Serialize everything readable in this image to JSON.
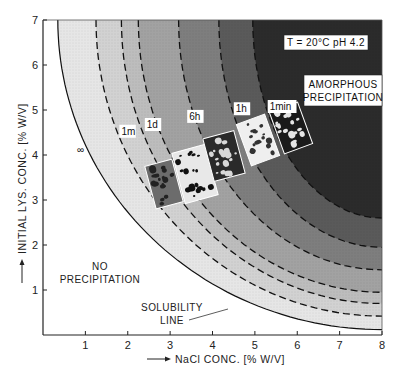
{
  "chart_data": {
    "type": "area",
    "title": "",
    "xlabel": "NaCl CONC. [% W/V]",
    "ylabel": "INITIAL LYS. CONC. [% W/V]",
    "xlim": [
      0,
      8
    ],
    "ylim": [
      0,
      7
    ],
    "x_ticks": [
      "1",
      "2",
      "3",
      "4",
      "5",
      "6",
      "7",
      "8"
    ],
    "y_ticks": [
      "1",
      "2",
      "3",
      "4",
      "5",
      "6",
      "7"
    ],
    "grid": false,
    "conditions_label": "T = 20°C  pH 4.2",
    "regions": [
      {
        "name": "NO PRECIPITATION",
        "label_lines": [
          "NO",
          "PRECIPITATION"
        ]
      },
      {
        "name": "AMORPHOUS PRECIPITATION",
        "label_lines": [
          "AMORPHOUS",
          "PRECIPITATION"
        ]
      }
    ],
    "solubility_label_lines": [
      "SOLUBILITY",
      "LINE"
    ],
    "boundaries": [
      {
        "name": "solubility line",
        "style": "solid",
        "label": "",
        "top_x": 0.35,
        "right_y": 0.12
      },
      {
        "name": "infinity",
        "style": "dashed",
        "label": "∞",
        "top_x": 1.25,
        "right_y": 0.42
      },
      {
        "name": "1 month",
        "style": "dashed",
        "label": "1m",
        "top_x": 1.85,
        "right_y": 0.7
      },
      {
        "name": "1 day",
        "style": "dashed",
        "label": "1d",
        "top_x": 2.25,
        "right_y": 0.95
      },
      {
        "name": "6 hours",
        "style": "dashed",
        "label": "6h",
        "top_x": 3.2,
        "right_y": 1.45
      },
      {
        "name": "1 hour",
        "style": "dashed",
        "label": "1h",
        "top_x": 4.15,
        "right_y": 1.95
      },
      {
        "name": "1 minute",
        "style": "dashed",
        "label": "1min",
        "top_x": 4.95,
        "right_y": 2.6
      }
    ],
    "band_shades": [
      "#ffffff",
      "#e6e6e6",
      "#d2d2d2",
      "#bdbdbd",
      "#a2a2a2",
      "#7e7e7e",
      "#5a5a5a",
      "#2b2b2b"
    ]
  }
}
